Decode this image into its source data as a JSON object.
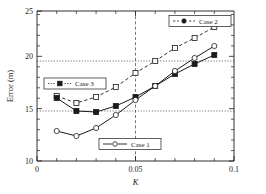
{
  "chart_data": {
    "type": "line",
    "title": "",
    "xlabel": "K",
    "ylabel": "Error (m)",
    "xlim": [
      0,
      0.1
    ],
    "ylim": [
      10,
      25
    ],
    "xticks": [
      0,
      0.05,
      0.1
    ],
    "xticklabels": [
      "0",
      "0.05",
      "0.1"
    ],
    "yticks": [
      10,
      15,
      20,
      25
    ],
    "yticklabels": [
      "10",
      "15",
      "20",
      "25"
    ],
    "x_minor_step": 0.01,
    "y_minor_step": 1,
    "grid": "dotted reference lines at y=15, y=20 and dashed vertical line at x=0.05",
    "gridlines_h": [
      15,
      20
    ],
    "gridlines_v": [
      0.05
    ],
    "legend_position": "inside-multiple",
    "x": [
      0.01,
      0.02,
      0.03,
      0.04,
      0.05,
      0.06,
      0.07,
      0.08,
      0.09
    ],
    "series": [
      {
        "name": "Case 1",
        "marker": "open-circle",
        "line": "solid",
        "color": "#1a1a1a",
        "values": [
          13.0,
          12.5,
          13.3,
          14.6,
          16.1,
          17.5,
          19.0,
          20.3,
          21.5
        ]
      },
      {
        "name": "Case 2",
        "marker": "open-square",
        "line": "dashed",
        "color": "#1a1a1a",
        "values": [
          16.5,
          15.8,
          16.4,
          17.4,
          18.8,
          20.0,
          21.3,
          22.3,
          23.4
        ]
      },
      {
        "name": "Case 3",
        "marker": "filled-square",
        "line": "solid",
        "color": "#1a1a1a",
        "values": [
          16.3,
          15.0,
          14.9,
          15.5,
          16.4,
          17.5,
          18.7,
          19.7,
          20.6
        ]
      }
    ],
    "legends": [
      {
        "label": "Case 2",
        "marker": "filled-circle",
        "line": "dashed"
      },
      {
        "label": "Case 3",
        "marker": "filled-square",
        "line": "dotted"
      },
      {
        "label": "Case 1",
        "marker": "open-circle",
        "line": "solid"
      }
    ]
  }
}
